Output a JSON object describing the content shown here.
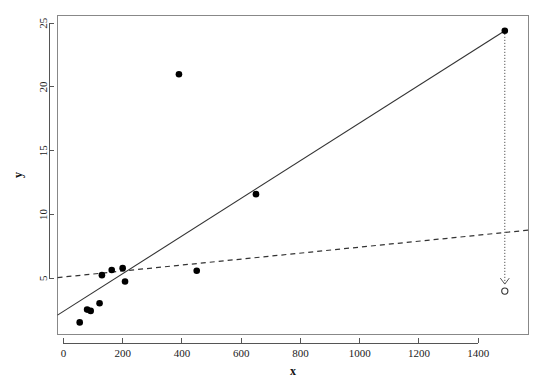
{
  "chart_data": {
    "type": "scatter",
    "title": "",
    "subtitle": "",
    "xlabel": "x",
    "ylabel": "y",
    "xlim": [
      -20,
      1570
    ],
    "ylim": [
      0.6,
      25.6
    ],
    "grid": false,
    "legend": null,
    "xticks": [
      0,
      200,
      400,
      600,
      800,
      1000,
      1200,
      1400
    ],
    "xtick_labels": [
      "0",
      "200",
      "400",
      "600",
      "800",
      "1000",
      "1200",
      "1400"
    ],
    "yticks": [
      5,
      10,
      15,
      20,
      25
    ],
    "ytick_labels": [
      "5",
      "10",
      "15",
      "20",
      "25"
    ],
    "points": [
      {
        "x": 55,
        "y": 1.55,
        "marker": "filled"
      },
      {
        "x": 80,
        "y": 2.55,
        "marker": "filled"
      },
      {
        "x": 92,
        "y": 2.45,
        "marker": "filled"
      },
      {
        "x": 122,
        "y": 3.05,
        "marker": "filled"
      },
      {
        "x": 130,
        "y": 5.25,
        "marker": "filled"
      },
      {
        "x": 163,
        "y": 5.65,
        "marker": "filled"
      },
      {
        "x": 200,
        "y": 5.8,
        "marker": "filled"
      },
      {
        "x": 208,
        "y": 4.75,
        "marker": "filled"
      },
      {
        "x": 390,
        "y": 21.0,
        "marker": "filled"
      },
      {
        "x": 450,
        "y": 5.6,
        "marker": "filled"
      },
      {
        "x": 650,
        "y": 11.6,
        "marker": "filled"
      },
      {
        "x": 1490,
        "y": 24.4,
        "marker": "filled"
      },
      {
        "x": 1490,
        "y": 4.0,
        "marker": "open"
      }
    ],
    "lines": [
      {
        "name": "solid-fit-line",
        "style": "solid",
        "x0": -20,
        "y0": 2.12,
        "x1": 1490,
        "y1": 24.4
      },
      {
        "name": "dashed-fit-line",
        "style": "dashed",
        "x0": -20,
        "y0": 5.06,
        "x1": 1570,
        "y1": 8.78
      }
    ],
    "annotations": [
      {
        "name": "leverage-drop-arrow",
        "type": "arrow",
        "x": 1490,
        "y_from": 24.4,
        "y_to": 4.55,
        "style": "dotted"
      }
    ]
  }
}
